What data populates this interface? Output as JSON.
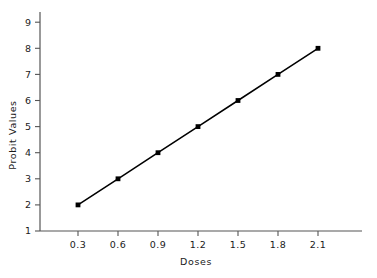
{
  "chart_data": {
    "type": "line",
    "title": "",
    "xlabel": "Doses",
    "ylabel": "Probit Values",
    "x": [
      0.3,
      0.6,
      0.9,
      1.2,
      1.5,
      1.8,
      2.1
    ],
    "values": [
      2,
      3,
      4,
      5,
      6,
      7,
      8
    ],
    "series": [
      {
        "name": "Probit regression line",
        "values": [
          2,
          3,
          4,
          5,
          6,
          7,
          8
        ]
      }
    ],
    "xtick_labels": [
      "0.3",
      "0.6",
      "0.9",
      "1.2",
      "1.5",
      "1.8",
      "2.1"
    ],
    "ytick_labels": [
      "1",
      "2",
      "3",
      "4",
      "5",
      "6",
      "7",
      "8",
      "9"
    ],
    "xlim": [
      0.15,
      2.4
    ],
    "ylim": [
      1,
      9.4
    ],
    "grid": false,
    "legend": "none",
    "marker": "square",
    "line_color": "#000000",
    "marker_color": "#000000",
    "background_color": "#ffffff",
    "axis_color": "#555555",
    "tick_direction": "out"
  },
  "axes": {
    "y_label": "Probit Values",
    "x_label": "Doses",
    "y_ticks": [
      {
        "label": "9",
        "value": 9
      },
      {
        "label": "8",
        "value": 8
      },
      {
        "label": "7",
        "value": 7
      },
      {
        "label": "6",
        "value": 6
      },
      {
        "label": "5",
        "value": 5
      },
      {
        "label": "4",
        "value": 4
      },
      {
        "label": "3",
        "value": 3
      },
      {
        "label": "2",
        "value": 2
      },
      {
        "label": "1",
        "value": 1
      }
    ],
    "x_ticks": [
      {
        "label": "0.3",
        "value": 0.3
      },
      {
        "label": "0.6",
        "value": 0.6
      },
      {
        "label": "0.9",
        "value": 0.9
      },
      {
        "label": "1.2",
        "value": 1.2
      },
      {
        "label": "1.5",
        "value": 1.5
      },
      {
        "label": "1.8",
        "value": 1.8
      },
      {
        "label": "2.1",
        "value": 2.1
      }
    ]
  }
}
